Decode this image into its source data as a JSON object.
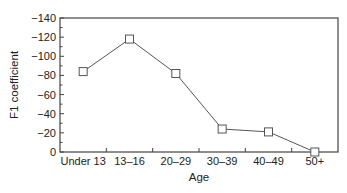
{
  "chart_data": {
    "type": "line",
    "title": "",
    "xlabel": "Age",
    "ylabel": "F1 coefficient",
    "categories": [
      "Under 13",
      "13–16",
      "20–29",
      "30–39",
      "40–49",
      "50+"
    ],
    "series": [
      {
        "name": "F1 coefficient",
        "values": [
          -84,
          -118,
          -82,
          -24,
          -21,
          0
        ],
        "marker": "open-square"
      }
    ],
    "ylim": [
      0,
      -140
    ],
    "y_axis_inverted": true,
    "yticks": [
      0,
      -20,
      -40,
      -60,
      -80,
      -100,
      -120,
      -140
    ],
    "ytick_labels": [
      "0",
      "−20",
      "−40",
      "−60",
      "−80",
      "−100",
      "−120",
      "−140"
    ],
    "grid": false,
    "legend": null
  },
  "colors": {
    "line": "#555555",
    "axis": "#444444",
    "text": "#222222",
    "marker_fill": "#ffffff"
  }
}
